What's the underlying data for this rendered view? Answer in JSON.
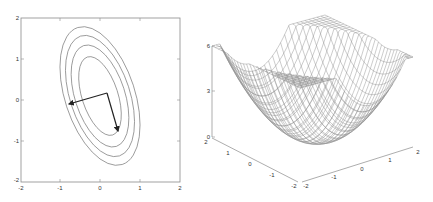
{
  "chart_data": [
    {
      "type": "contour",
      "title": "",
      "xlabel": "",
      "ylabel": "",
      "xlim": [
        -2,
        2
      ],
      "ylim": [
        -2,
        2
      ],
      "xticks": [
        "-2",
        "-1",
        "0",
        "1",
        "2"
      ],
      "yticks": [
        "2",
        "1",
        "0",
        "-1",
        "-2"
      ],
      "grid": false,
      "contours": [
        {
          "level": 1,
          "center": [
            0.0,
            0.1
          ],
          "semi_axes": [
            0.45,
            1.0
          ],
          "rotation_deg": -18
        },
        {
          "level": 2,
          "center": [
            0.0,
            0.1
          ],
          "semi_axes": [
            0.62,
            1.3
          ],
          "rotation_deg": -18
        },
        {
          "level": 3,
          "center": [
            0.0,
            0.1
          ],
          "semi_axes": [
            0.75,
            1.55
          ],
          "rotation_deg": -18
        },
        {
          "level": 4,
          "center": [
            0.0,
            0.1
          ],
          "semi_axes": [
            0.87,
            1.78
          ],
          "rotation_deg": -18
        }
      ],
      "arrows": [
        {
          "from": [
            0.18,
            0.17
          ],
          "to": [
            -0.8,
            -0.1
          ]
        },
        {
          "from": [
            0.18,
            0.17
          ],
          "to": [
            0.45,
            -0.8
          ]
        }
      ],
      "color": "#7f7f7f",
      "arrow_color": "#222222"
    },
    {
      "type": "surface",
      "title": "",
      "xlim": [
        -2,
        2
      ],
      "ylim": [
        -2,
        2
      ],
      "zlim": [
        0,
        6
      ],
      "xticks": [
        "-2",
        "-1",
        "0",
        "1",
        "2"
      ],
      "yticks": [
        "2",
        "1",
        "0",
        "-1",
        "-2"
      ],
      "zticks": [
        "0",
        "3",
        "6"
      ],
      "description": "Quadratic bowl (paraboloid) mesh, clipped flat at z = 6",
      "mesh_color": "#8c8c8c"
    }
  ],
  "left_plot": {
    "yticks": [
      {
        "label": "2",
        "y": 18
      },
      {
        "label": "1",
        "y": 59
      },
      {
        "label": "0",
        "y": 100
      },
      {
        "label": "-1",
        "y": 141
      },
      {
        "label": "-2",
        "y": 182
      }
    ],
    "xticks": [
      {
        "label": "-2",
        "x": 21
      },
      {
        "label": "-1",
        "x": 60
      },
      {
        "label": "0",
        "x": 100
      },
      {
        "label": "1",
        "x": 140
      },
      {
        "label": "2",
        "x": 180
      }
    ]
  },
  "right_plot": {
    "zticks": [
      {
        "label": "6",
        "y": 46
      },
      {
        "label": "3",
        "y": 91
      },
      {
        "label": "0",
        "y": 137
      }
    ],
    "left_axis_ticks": [
      "2",
      "1",
      "0",
      "-1",
      "-2"
    ],
    "right_axis_ticks": [
      "-2",
      "-1",
      "0",
      "1",
      "2"
    ]
  }
}
